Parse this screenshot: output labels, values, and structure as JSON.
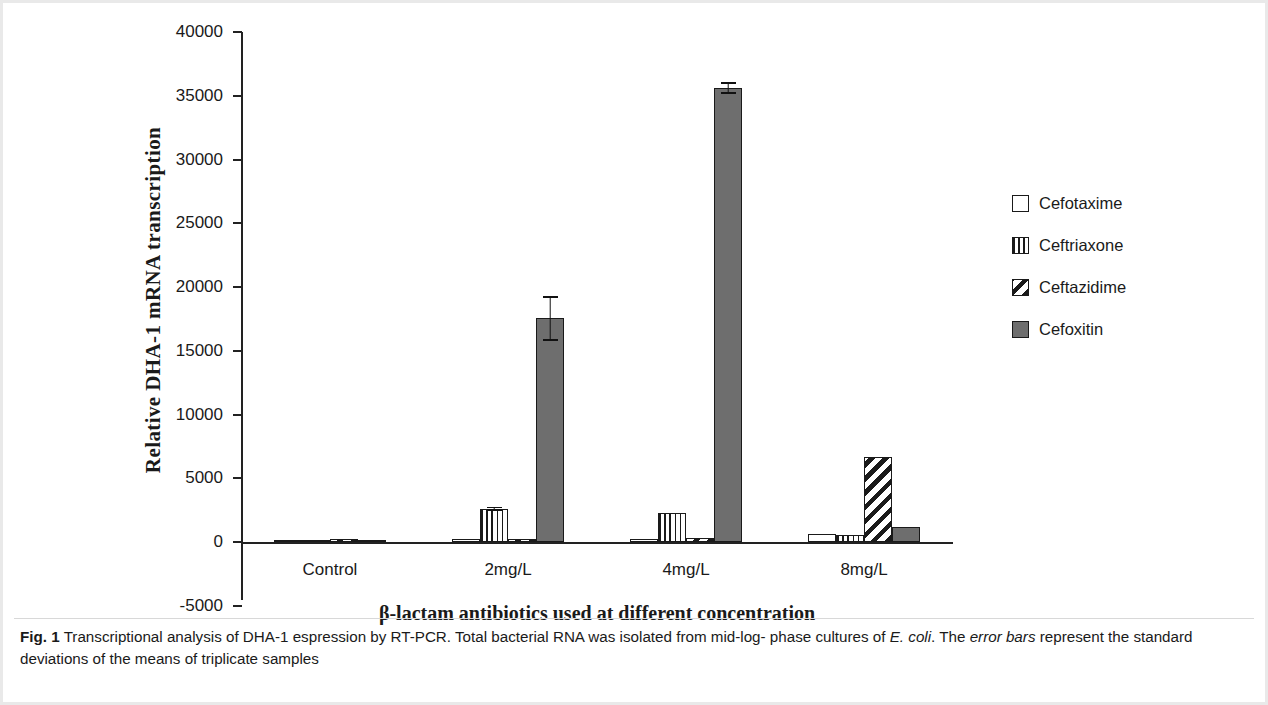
{
  "chart_data": {
    "type": "bar",
    "title": "",
    "xlabel": "β-lactam antibiotics used at different concentration",
    "ylabel": "Relative DHA-1 mRNA transcription",
    "categories": [
      "Control",
      "2mg/L",
      "4mg/L",
      "8mg/L"
    ],
    "ylim": [
      -5000,
      40000
    ],
    "ytick_values": [
      -5000,
      0,
      5000,
      10000,
      15000,
      20000,
      25000,
      30000,
      35000,
      40000
    ],
    "ytick_labels": [
      "-5000",
      "0",
      "5000",
      "10000",
      "15000",
      "20000",
      "25000",
      "30000",
      "35000",
      "40000"
    ],
    "grid": false,
    "legend_position": "right",
    "series": [
      {
        "name": "Cefotaxime",
        "fill": "empty",
        "values": [
          0,
          180,
          120,
          620
        ],
        "errors": [
          0,
          0,
          0,
          0
        ]
      },
      {
        "name": "Ceftriaxone",
        "fill": "vertical",
        "values": [
          0,
          2600,
          2250,
          560
        ],
        "errors": [
          0,
          180,
          0,
          0
        ]
      },
      {
        "name": "Ceftazidime",
        "fill": "diagonal",
        "values": [
          250,
          230,
          290,
          6700
        ],
        "errors": [
          0,
          0,
          0,
          0
        ]
      },
      {
        "name": "Cefoxitin",
        "fill": "solid",
        "values": [
          0,
          17550,
          35600,
          1150
        ],
        "errors": [
          0,
          1750,
          450,
          0
        ]
      }
    ]
  },
  "legend": {
    "items": [
      {
        "label": "Cefotaxime",
        "fill": "empty"
      },
      {
        "label": "Ceftriaxone",
        "fill": "vertical"
      },
      {
        "label": "Ceftazidime",
        "fill": "diagonal"
      },
      {
        "label": "Cefoxitin",
        "fill": "solid"
      }
    ]
  },
  "caption": {
    "figure_number": "Fig. 1",
    "text_part_1": "Transcriptional analysis of DHA-1 espression by RT-PCR. Total bacterial RNA was isolated from mid-log- phase cultures of ",
    "italic_1": "E. coli",
    "text_part_2": ". The ",
    "italic_2": "error bars",
    "text_part_3": " represent the standard deviations of the means of triplicate samples"
  }
}
